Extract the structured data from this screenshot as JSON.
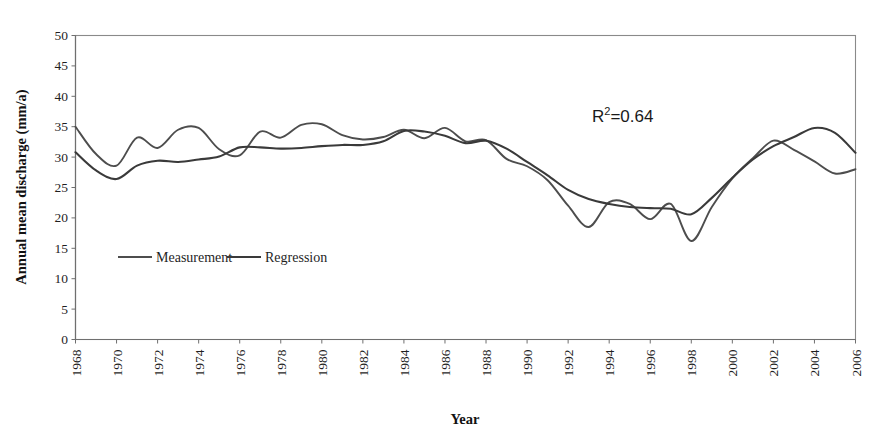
{
  "figure": {
    "caption_remnant": "hydrological regime change was detected, crop and cropland; a change of a",
    "background": "#ffffff"
  },
  "chart_data": {
    "type": "line",
    "title": "",
    "xlabel": "Year",
    "ylabel": "Annual mean discharge (mm/a)",
    "xlim": [
      1968,
      2006
    ],
    "ylim": [
      0,
      50
    ],
    "ytick_step": 5,
    "xtick_step": 2,
    "grid": false,
    "legend_position": "inside-lower-left",
    "annotations": [
      {
        "text": "R2=0.64",
        "display_base": "R",
        "display_sup": "2",
        "display_rest": "=0.64",
        "x": 1994.5,
        "y": 39.5
      }
    ],
    "yticks": [
      0,
      5,
      10,
      15,
      20,
      25,
      30,
      35,
      40,
      45,
      50
    ],
    "xticks": [
      1968,
      1970,
      1972,
      1974,
      1976,
      1978,
      1980,
      1982,
      1984,
      1986,
      1988,
      1990,
      1992,
      1994,
      1996,
      1998,
      2000,
      2002,
      2004,
      2006
    ],
    "x": [
      1968,
      1969,
      1970,
      1971,
      1972,
      1973,
      1974,
      1975,
      1976,
      1977,
      1978,
      1979,
      1980,
      1981,
      1982,
      1983,
      1984,
      1985,
      1986,
      1987,
      1988,
      1989,
      1990,
      1991,
      1992,
      1993,
      1994,
      1995,
      1996,
      1997,
      1998,
      1999,
      2000,
      2001,
      2002,
      2003,
      2004,
      2005,
      2006
    ],
    "series": [
      {
        "name": "Measurement",
        "color": "#4d4d4d",
        "width": 1.9,
        "values": [
          35.0,
          30.5,
          28.6,
          33.2,
          31.5,
          34.5,
          34.8,
          31.3,
          30.3,
          34.2,
          33.2,
          35.3,
          35.4,
          33.6,
          32.9,
          33.3,
          34.5,
          33.1,
          34.8,
          32.6,
          32.8,
          29.7,
          28.5,
          26.2,
          22.0,
          18.5,
          22.6,
          22.3,
          19.8,
          22.3,
          16.2,
          21.8,
          26.5,
          29.8,
          32.7,
          31.2,
          29.3,
          27.3,
          28.0
        ]
      },
      {
        "name": "Regression",
        "color": "#3a3a3a",
        "width": 2.1,
        "values": [
          30.8,
          27.8,
          26.4,
          28.6,
          29.4,
          29.2,
          29.6,
          30.1,
          31.6,
          31.6,
          31.4,
          31.5,
          31.8,
          32.0,
          32.0,
          32.6,
          34.3,
          34.2,
          33.5,
          32.3,
          32.7,
          31.4,
          29.2,
          27.0,
          24.6,
          23.1,
          22.3,
          21.8,
          21.6,
          21.5,
          20.6,
          23.3,
          26.6,
          29.6,
          31.8,
          33.3,
          34.8,
          34.0,
          30.7
        ]
      }
    ]
  },
  "legend": {
    "items": [
      {
        "label": "Measurement",
        "color": "#4d4d4d"
      },
      {
        "label": "Regression",
        "color": "#3a3a3a"
      }
    ]
  }
}
